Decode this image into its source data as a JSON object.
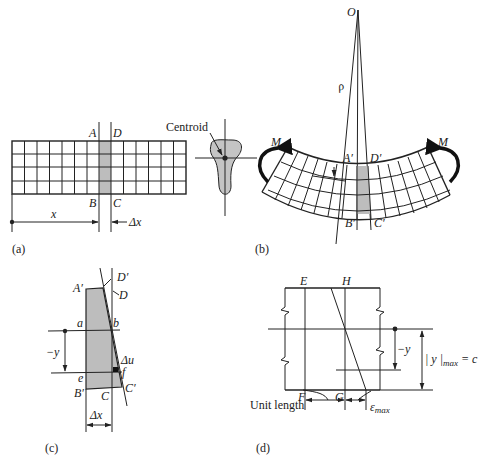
{
  "figure": {
    "panels": [
      {
        "id": "a",
        "caption": "(a)"
      },
      {
        "id": "b",
        "caption": "(b)"
      },
      {
        "id": "c",
        "caption": "(c)"
      },
      {
        "id": "d",
        "caption": "(d)"
      }
    ]
  },
  "panel_a": {
    "caption": "(a)",
    "labels": {
      "A": "A",
      "D": "D",
      "B": "B",
      "C": "C",
      "x": "x",
      "dx": "Δx"
    },
    "grid": {
      "rows": 4,
      "columns": 14
    }
  },
  "cross_section": {
    "label": "Centroid"
  },
  "panel_b": {
    "caption": "(b)",
    "labels": {
      "O": "O",
      "rho": "ρ",
      "M_left": "M",
      "M_right": "M",
      "A_prime": "A′",
      "D_prime": "D′",
      "B_prime": "B′",
      "C_prime": "C′"
    }
  },
  "panel_c": {
    "caption": "(c)",
    "labels": {
      "A_prime": "A′",
      "D_prime": "D′",
      "D": "D",
      "a": "a",
      "b": "b",
      "neg_y": "−y",
      "du": "Δu",
      "f": "f",
      "e": "e",
      "B_prime": "B′",
      "C": "C",
      "C_prime": "C′",
      "dx": "Δx"
    }
  },
  "panel_d": {
    "caption": "(d)",
    "labels": {
      "E": "E",
      "H": "H",
      "F": "F",
      "G": "G",
      "neg_y": "−y",
      "ymax": "| y |",
      "ymax_sub": "max",
      "ymax_eq": " = c",
      "unit_length": "Unit length",
      "eps": "ε",
      "eps_sub": "max"
    }
  },
  "colors": {
    "line": "#222222",
    "shade": "#bdbdbd",
    "background": "#ffffff"
  }
}
